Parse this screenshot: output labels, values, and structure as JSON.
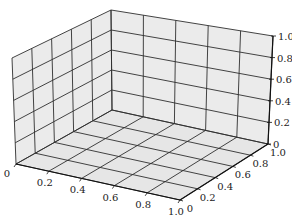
{
  "chart_data": {
    "type": "scatter",
    "projection": "3d",
    "title": "",
    "xlabel": "",
    "ylabel": "",
    "zlabel": "",
    "x_ticks": [
      "0",
      "0.2",
      "0.4",
      "0.6",
      "0.8",
      "1.0"
    ],
    "y_ticks": [
      "0",
      "0.2",
      "0.4",
      "0.6",
      "0.8",
      "1.0"
    ],
    "z_ticks": [
      "0",
      "0.2",
      "0.4",
      "0.6",
      "0.8",
      "1.0"
    ],
    "xlim": [
      0,
      1
    ],
    "ylim": [
      0,
      1
    ],
    "zlim": [
      0,
      1
    ],
    "grid": true,
    "series": [],
    "legend": null
  },
  "colors": {
    "pane": "#ebebeb",
    "grid": "#2f2f2f",
    "text": "#222222"
  }
}
